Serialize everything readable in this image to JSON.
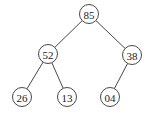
{
  "diagram": {
    "type": "binary-tree",
    "radius": 9.5,
    "nodes": [
      {
        "id": "n85",
        "label": "85",
        "x": 89,
        "y": 14
      },
      {
        "id": "n52",
        "label": "52",
        "x": 48,
        "y": 54
      },
      {
        "id": "n38",
        "label": "38",
        "x": 132,
        "y": 55
      },
      {
        "id": "n26",
        "label": "26",
        "x": 22,
        "y": 97
      },
      {
        "id": "n13",
        "label": "13",
        "x": 67,
        "y": 97
      },
      {
        "id": "n04",
        "label": "04",
        "x": 110,
        "y": 97
      }
    ],
    "edges": [
      {
        "from": "n85",
        "to": "n52"
      },
      {
        "from": "n85",
        "to": "n38"
      },
      {
        "from": "n52",
        "to": "n26"
      },
      {
        "from": "n52",
        "to": "n13"
      },
      {
        "from": "n38",
        "to": "n04"
      }
    ]
  }
}
